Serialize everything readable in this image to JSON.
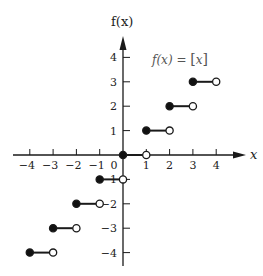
{
  "chart_data": {
    "type": "line",
    "subtype": "step",
    "title": "",
    "function_label": "f(x) = [x]",
    "function_label_parts": {
      "lhs": "f(x) = ",
      "open": "[",
      "var": "x",
      "close": "]"
    },
    "xlabel": "x",
    "ylabel": "f(x)",
    "xlim": [
      -4.5,
      5
    ],
    "ylim": [
      -4.5,
      5
    ],
    "x_ticks": [
      -4,
      -3,
      -2,
      -1,
      0,
      1,
      2,
      3,
      4
    ],
    "x_tick_labels": [
      "−4",
      "−3",
      "−2",
      "−1",
      "0",
      "1",
      "2",
      "3",
      "4"
    ],
    "y_ticks": [
      4,
      3,
      2,
      1,
      -1,
      -2,
      -3,
      -4
    ],
    "y_tick_labels": [
      "4",
      "3",
      "2",
      "1",
      "−1",
      "−2",
      "−3",
      "−4"
    ],
    "grid": false,
    "legend": null,
    "segments": [
      {
        "x_start": -4,
        "x_end": -3,
        "y": -4,
        "start_closed": true,
        "end_closed": false
      },
      {
        "x_start": -3,
        "x_end": -2,
        "y": -3,
        "start_closed": true,
        "end_closed": false
      },
      {
        "x_start": -2,
        "x_end": -1,
        "y": -2,
        "start_closed": true,
        "end_closed": false
      },
      {
        "x_start": -1,
        "x_end": 0,
        "y": -1,
        "start_closed": true,
        "end_closed": false
      },
      {
        "x_start": 0,
        "x_end": 1,
        "y": 0,
        "start_closed": true,
        "end_closed": false
      },
      {
        "x_start": 1,
        "x_end": 2,
        "y": 1,
        "start_closed": true,
        "end_closed": false
      },
      {
        "x_start": 2,
        "x_end": 3,
        "y": 2,
        "start_closed": true,
        "end_closed": false
      },
      {
        "x_start": 3,
        "x_end": 4,
        "y": 3,
        "start_closed": true,
        "end_closed": false
      }
    ],
    "colors": {
      "axis": "#1a1a1a",
      "segment": "#1a1a1a",
      "closed_dot": "#111111",
      "open_dot_fill": "#ffffff",
      "label": "#222222",
      "formula": "#555555"
    }
  }
}
